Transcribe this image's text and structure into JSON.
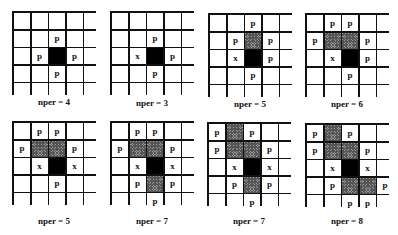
{
  "legend": {
    "p": "p",
    "x": "x"
  },
  "colors": {
    "grid_line": "#111111",
    "center": "#000000",
    "hatched": "#9a9a9a",
    "background": "#ffffff"
  },
  "panels": [
    {
      "label": "nper = 4",
      "x": 12,
      "y": 11,
      "label_y": 97,
      "cells": [
        [
          "",
          "",
          "",
          "",
          ""
        ],
        [
          "",
          "",
          "p",
          "",
          ""
        ],
        [
          "",
          "p",
          "#",
          "p",
          ""
        ],
        [
          "",
          "",
          "p",
          "",
          ""
        ],
        [
          "",
          "",
          "",
          "",
          ""
        ]
      ]
    },
    {
      "label": "nper = 3",
      "x": 110,
      "y": 11,
      "label_y": 98,
      "cells": [
        [
          "",
          "",
          "",
          "",
          ""
        ],
        [
          "",
          "",
          "p",
          "",
          ""
        ],
        [
          "",
          "x",
          "#",
          "p",
          ""
        ],
        [
          "",
          "",
          "p",
          "",
          ""
        ],
        [
          "",
          "",
          "",
          "",
          ""
        ]
      ]
    },
    {
      "label": "nper = 5",
      "x": 208,
      "y": 13,
      "label_y": 99,
      "cells": [
        [
          "",
          "",
          "p",
          "",
          ""
        ],
        [
          "",
          "p",
          "h",
          "p",
          ""
        ],
        [
          "",
          "x",
          "#",
          "p",
          ""
        ],
        [
          "",
          "",
          "p",
          "",
          ""
        ],
        [
          "",
          "",
          "",
          "",
          ""
        ]
      ]
    },
    {
      "label": "nper = 6",
      "x": 305,
      "y": 13,
      "label_y": 99,
      "cells": [
        [
          "",
          "p",
          "p",
          "",
          ""
        ],
        [
          "p",
          "h",
          "h",
          "p",
          ""
        ],
        [
          "",
          "x",
          "#",
          "p",
          ""
        ],
        [
          "",
          "",
          "p",
          "",
          ""
        ],
        [
          "",
          "",
          "",
          "",
          ""
        ]
      ]
    },
    {
      "label": "nper = 5",
      "x": 12,
      "y": 121,
      "label_y": 216,
      "cells": [
        [
          "",
          "p",
          "p",
          "",
          ""
        ],
        [
          "p",
          "h",
          "h",
          "p",
          ""
        ],
        [
          "",
          "x",
          "#",
          "x",
          ""
        ],
        [
          "",
          "",
          "p",
          "",
          ""
        ],
        [
          "",
          "",
          "",
          "",
          ""
        ]
      ]
    },
    {
      "label": "nper = 7",
      "x": 110,
      "y": 121,
      "label_y": 216,
      "cells": [
        [
          "",
          "p",
          "p",
          "",
          ""
        ],
        [
          "p",
          "h",
          "h",
          "p",
          ""
        ],
        [
          "",
          "x",
          "#",
          "x",
          ""
        ],
        [
          "",
          "p",
          "h",
          "p",
          ""
        ],
        [
          "",
          "",
          "p",
          "",
          ""
        ]
      ]
    },
    {
      "label": "nper = 7",
      "x": 207,
      "y": 122,
      "label_y": 216,
      "cells": [
        [
          "p",
          "h",
          "p",
          "",
          ""
        ],
        [
          "p",
          "h",
          "h",
          "p",
          ""
        ],
        [
          "",
          "x",
          "#",
          "x",
          ""
        ],
        [
          "",
          "p",
          "h",
          "p",
          ""
        ],
        [
          "",
          "",
          "p",
          "",
          ""
        ]
      ]
    },
    {
      "label": "nper = 8",
      "x": 305,
      "y": 123,
      "label_y": 216,
      "cells": [
        [
          "p",
          "h",
          "p",
          "",
          ""
        ],
        [
          "p",
          "h",
          "h",
          "p",
          ""
        ],
        [
          "",
          "x",
          "#",
          "x",
          ""
        ],
        [
          "",
          "p",
          "h",
          "h",
          "p"
        ],
        [
          "",
          "",
          "p",
          "p",
          ""
        ]
      ]
    }
  ]
}
